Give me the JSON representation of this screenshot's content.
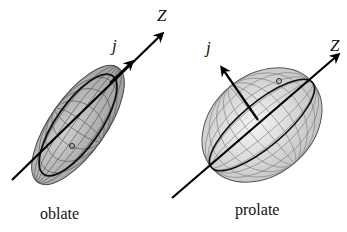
{
  "figure": {
    "panels": [
      {
        "id": "oblate",
        "caption": "oblate",
        "axis_labels": {
          "z": "Z",
          "j": "j"
        },
        "fill_color": "#b8b8b8",
        "grid_color": "#555555"
      },
      {
        "id": "prolate",
        "caption": "prolate",
        "axis_labels": {
          "z": "Z",
          "j": "j"
        },
        "fill_color": "#dcdcdc",
        "grid_color": "#666666"
      }
    ],
    "axis_color": "#000000"
  }
}
